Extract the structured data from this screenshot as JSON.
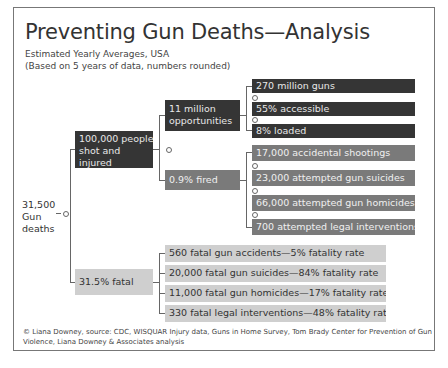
{
  "title": "Preventing Gun Deaths—Analysis",
  "subtitle_line1": "Estimated Yearly Averages, USA",
  "subtitle_line2": "(Based on 5 years of data, numbers rounded)",
  "root": {
    "line1": "31,500",
    "line2": "Gun",
    "line3": "deaths"
  },
  "branches": {
    "injured": {
      "line1": "100,000 people",
      "line2": "shot and",
      "line3": "injured"
    },
    "opportunities": {
      "line1": "11 million",
      "line2": "opportunities"
    },
    "opportunity_items": [
      "270 million guns",
      "55% accessible",
      "8% loaded"
    ],
    "fired": "0.9% fired",
    "fired_items": [
      "17,000 accidental shootings",
      "23,000 attempted gun suicides",
      "66,000 attempted gun homicides",
      "700 attempted legal interventions"
    ],
    "fatal": "31.5% fatal",
    "fatal_items": [
      "560 fatal gun accidents—5% fatality rate",
      "20,000 fatal gun suicides—84% fatality rate",
      "11,000 fatal gun homicides—17% fatality rate",
      "330 fatal legal interventions—48% fatality rate"
    ]
  },
  "footer": "© Liana Downey, source: CDC, WISQUAR Injury data, Guns in Home Survey, Tom Brady Center for Prevention of Gun Violence, Liana Downey & Associates analysis",
  "colors": {
    "dark": "#353535",
    "mid": "#7a7a7a",
    "light": "#cfcfcf"
  }
}
